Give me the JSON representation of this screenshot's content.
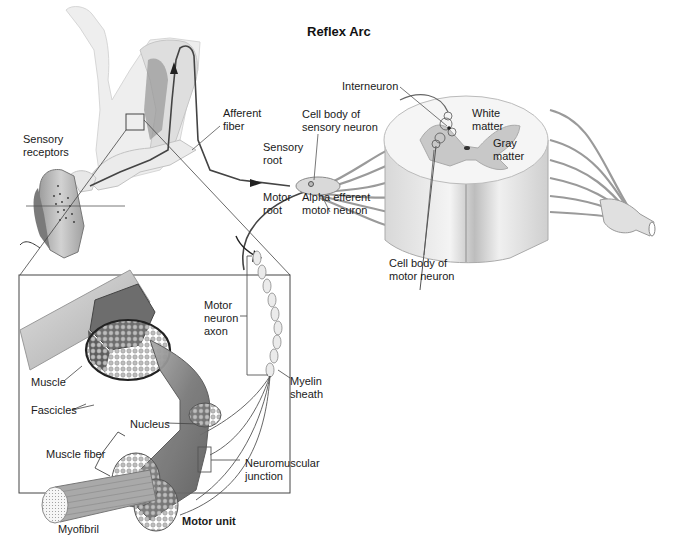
{
  "title": "Reflex Arc",
  "labels": {
    "afferent_fiber": "Afferent\nfiber",
    "sensory_receptors": "Sensory\nreceptors",
    "sensory_root": "Sensory\nroot",
    "cell_body_sensory": "Cell body of\nsensory neuron",
    "motor_root": "Motor\nroot",
    "alpha_efferent": "Alpha efferent\nmotor neuron",
    "interneuron": "Interneuron",
    "white_matter": "White\nmatter",
    "gray_matter": "Gray\nmatter",
    "cell_body_motor": "Cell body of\nmotor neuron",
    "motor_neuron_axon": "Motor\nneuron\naxon",
    "myelin_sheath": "Myelin\nsheath",
    "muscle": "Muscle",
    "fascicles": "Fascicles",
    "nucleus": "Nucleus",
    "muscle_fiber": "Muscle fiber",
    "neuromuscular_junction": "Neuromuscular\njunction",
    "myofibril": "Myofibril",
    "motor_unit": "Motor unit"
  },
  "colors": {
    "ink": "#1a1a1a",
    "line": "#555555",
    "skin": "#e4e4e4",
    "muscle_dark": "#6e6e6e",
    "muscle_mid": "#9a9a9a",
    "spinal_white": "#f2f2f2",
    "spinal_gray": "#c8c8c8",
    "background": "#ffffff"
  }
}
